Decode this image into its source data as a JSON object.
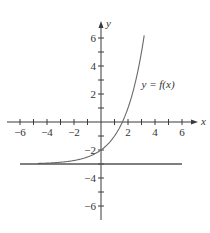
{
  "chart_data": {
    "type": "line",
    "title": "",
    "xlabel": "x",
    "ylabel": "y",
    "xlim": [
      -7,
      7
    ],
    "ylim": [
      -7,
      7
    ],
    "x_ticks": [
      -6,
      -5,
      -4,
      -3,
      -2,
      -1,
      1,
      2,
      3,
      4,
      5,
      6
    ],
    "x_tick_labels": [
      {
        "value": -6,
        "text": "−6"
      },
      {
        "value": -4,
        "text": "−4"
      },
      {
        "value": -2,
        "text": "−2"
      },
      {
        "value": 2,
        "text": "2"
      },
      {
        "value": 4,
        "text": "4"
      },
      {
        "value": 6,
        "text": "6"
      }
    ],
    "y_ticks": [
      -6,
      -5,
      -4,
      -3,
      -2,
      -1,
      1,
      2,
      3,
      4,
      5,
      6
    ],
    "y_tick_labels": [
      {
        "value": 6,
        "text": "6"
      },
      {
        "value": 4,
        "text": "4"
      },
      {
        "value": 2,
        "text": "2"
      },
      {
        "value": -2,
        "text": "−2"
      },
      {
        "value": -4,
        "text": "−4"
      },
      {
        "value": -6,
        "text": "−6"
      }
    ],
    "grid": false,
    "series": [
      {
        "name": "y = f(x)",
        "formula": "2^x - 3",
        "x": [
          -4.7,
          -4,
          -3,
          -2,
          -1,
          0,
          1,
          1.58,
          2,
          2.5,
          3,
          3.2
        ],
        "values": [
          -2.96,
          -2.94,
          -2.88,
          -2.75,
          -2.5,
          -2,
          -1,
          0,
          1,
          2.66,
          5,
          6.19
        ]
      },
      {
        "name": "horizontal asymptote",
        "x": [
          -6,
          6
        ],
        "values": [
          -3,
          -3
        ]
      }
    ],
    "annotations": [
      {
        "text": "y = f(x)",
        "x": 3.0,
        "y": 2.4
      }
    ]
  }
}
